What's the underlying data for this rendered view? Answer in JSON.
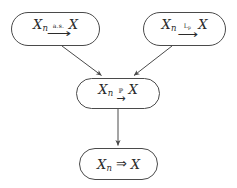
{
  "diagram": {
    "background_color": "#ffffff",
    "stroke_color": "#4a4a4a",
    "text_color": "#2b2b2b",
    "nodes": [
      {
        "id": "almost-sure",
        "lhs_var": "X",
        "lhs_sub": "n",
        "arrow_label": "a.s.",
        "arrow_glyph": "⟶",
        "rhs_var": "X",
        "full_text": "X_n --a.s.--> X"
      },
      {
        "id": "lp",
        "lhs_var": "X",
        "lhs_sub": "n",
        "arrow_label_main": "L",
        "arrow_label_sub": "p",
        "arrow_glyph": "⟶",
        "rhs_var": "X",
        "full_text": "X_n --L_p--> X"
      },
      {
        "id": "probability",
        "lhs_var": "X",
        "lhs_sub": "n",
        "arrow_label": "ℙ",
        "arrow_glyph": "→",
        "rhs_var": "X",
        "full_text": "X_n --P--> X"
      },
      {
        "id": "distribution",
        "lhs_var": "X",
        "lhs_sub": "n",
        "arrow_glyph": "⇒",
        "rhs_var": "X",
        "full_text": "X_n => X"
      }
    ],
    "edges": [
      {
        "id": "as-to-p",
        "from": "almost-sure",
        "to": "probability"
      },
      {
        "id": "lp-to-p",
        "from": "lp",
        "to": "probability"
      },
      {
        "id": "p-to-dist",
        "from": "probability",
        "to": "distribution"
      }
    ]
  }
}
